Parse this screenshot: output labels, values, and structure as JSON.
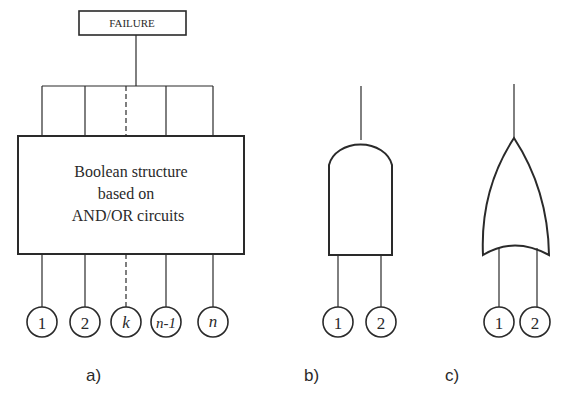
{
  "diagram_a": {
    "top_box_label": "FAILURE",
    "main_box_lines": [
      "Boolean structure",
      "based on",
      "AND/OR circuits"
    ],
    "inputs": [
      "1",
      "2",
      "k",
      "n-1",
      "n"
    ],
    "caption": "a)"
  },
  "diagram_b": {
    "gate": "AND",
    "inputs": [
      "1",
      "2"
    ],
    "caption": "b)"
  },
  "diagram_c": {
    "gate": "OR",
    "inputs": [
      "1",
      "2"
    ],
    "caption": "c)"
  },
  "colors": {
    "stroke": "#2a2a2a",
    "background": "#ffffff"
  }
}
